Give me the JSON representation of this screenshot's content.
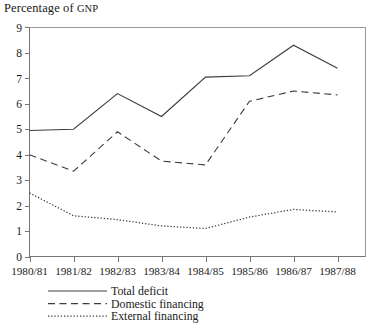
{
  "chart_data": {
    "type": "line",
    "title": "Percentage of GNP",
    "title_main": "Percentage of ",
    "title_smallcaps": "GNP",
    "xlabel": "",
    "ylabel": "",
    "categories": [
      "1980/81",
      "1981/82",
      "1982/83",
      "1983/84",
      "1984/85",
      "1985/86",
      "1986/87",
      "1987/88"
    ],
    "ylim": [
      0,
      9
    ],
    "ytick_labels": [
      "0",
      "1",
      "2",
      "3",
      "4",
      "5",
      "6",
      "7",
      "8",
      "9"
    ],
    "yticks": [
      0,
      1,
      2,
      3,
      4,
      5,
      6,
      7,
      8,
      9
    ],
    "grid": false,
    "legend_position": "below-left",
    "series": [
      {
        "name": "Total deficit",
        "style": "solid",
        "color": "#3c3c3c",
        "values": [
          4.95,
          5.0,
          6.4,
          5.5,
          7.05,
          7.1,
          8.3,
          7.4
        ]
      },
      {
        "name": "Domestic financing",
        "style": "dashed",
        "color": "#3c3c3c",
        "values": [
          4.0,
          3.35,
          4.9,
          3.75,
          3.6,
          6.1,
          6.5,
          6.35
        ]
      },
      {
        "name": "External financing",
        "style": "dotted",
        "color": "#3c3c3c",
        "values": [
          2.5,
          1.6,
          1.45,
          1.2,
          1.1,
          1.55,
          1.85,
          1.75
        ]
      }
    ]
  },
  "legend": {
    "items": [
      {
        "label": "Total deficit",
        "style": "solid"
      },
      {
        "label": "Domestic financing",
        "style": "dashed"
      },
      {
        "label": "External financing",
        "style": "dotted"
      }
    ]
  }
}
